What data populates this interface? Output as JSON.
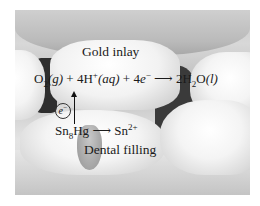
{
  "figure": {
    "labels": {
      "gold_inlay": "Gold inlay",
      "dental_filling": "Dental filling"
    },
    "reactions": {
      "cathode": {
        "o2": "O",
        "o2_sub": "2",
        "o2_state": "(g)",
        "plus1": " + 4H",
        "h_sup": "+",
        "h_state": "(aq)",
        "plus2": " + 4",
        "electron": "e",
        "electron_sup": "−",
        "arrow": " ⟶ ",
        "product_coef": "2H",
        "product_sub": "2",
        "product_o": "O",
        "product_state": "(l)"
      },
      "anode": {
        "reactant": "Sn",
        "reactant_sub": "8",
        "reactant_tail": "Hg",
        "arrow": " ⟶ ",
        "product": "Sn",
        "product_sup": "2+"
      }
    },
    "electron_symbol": {
      "letter": "e",
      "sup": "−"
    }
  }
}
